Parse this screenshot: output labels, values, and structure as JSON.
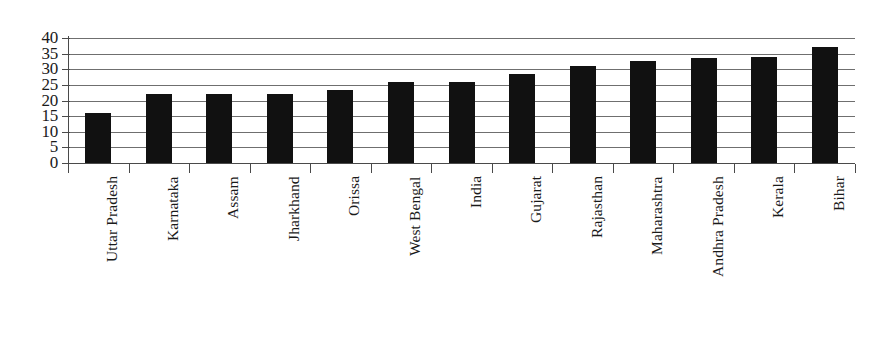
{
  "chart_data": {
    "type": "bar",
    "title": "",
    "subtitle": "",
    "xlabel": "",
    "ylabel": "",
    "ylim": [
      0,
      40
    ],
    "ytick_step": 5,
    "yticks": [
      0,
      5,
      10,
      15,
      20,
      25,
      30,
      35,
      40
    ],
    "grid": true,
    "legend": false,
    "legend_position": "none",
    "bar_color": "#111111",
    "gridline_color": "#6f6f6f",
    "axis_color": "#4a4a4a",
    "categories": [
      "Uttar Pradesh",
      "Karnataka",
      "Assam",
      "Jharkhand",
      "Orissa",
      "West Bengal",
      "India",
      "Gujarat",
      "Rajasthan",
      "Maharashtra",
      "Andhra Pradesh",
      "Kerala",
      "Bihar"
    ],
    "values": [
      16,
      22,
      22,
      22,
      23.5,
      26,
      26,
      28.5,
      31,
      32.5,
      33.5,
      34,
      37
    ]
  }
}
